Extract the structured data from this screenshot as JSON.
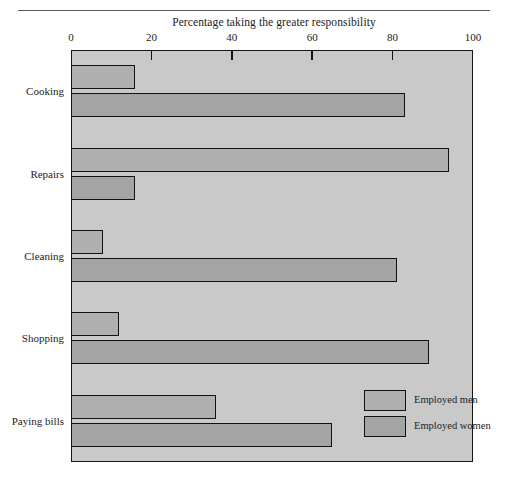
{
  "chart_data": {
    "type": "bar",
    "orientation": "horizontal",
    "title": "Percentage taking the greater responsibility",
    "xlabel": "",
    "ylabel": "",
    "xlim": [
      0,
      100
    ],
    "xticks": [
      0,
      20,
      40,
      60,
      80,
      100
    ],
    "xtick_labels": [
      "0",
      "20",
      "40",
      "60",
      "80",
      "100"
    ],
    "grid": false,
    "legend_position": "inside-bottom-right",
    "categories": [
      "Cooking",
      "Repairs",
      "Cleaning",
      "Shopping",
      "Paying bills"
    ],
    "series": [
      {
        "name": "Employed men",
        "values": [
          16,
          94,
          8,
          12,
          36
        ],
        "color": "#b0b0b0"
      },
      {
        "name": "Employed women",
        "values": [
          83,
          16,
          81,
          89,
          65
        ],
        "color": "#a4a4a4"
      }
    ]
  },
  "legend": {
    "entries": [
      {
        "label": "Employed men"
      },
      {
        "label": "Employed women"
      }
    ]
  }
}
